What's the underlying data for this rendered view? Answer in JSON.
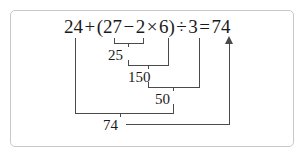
{
  "figure": {
    "line_color": "#4a4a4a",
    "frame_color": "#c9c9c9",
    "text_color": "#1a1a1a"
  },
  "equation": {
    "full_text": "24+(27-2×6)÷3=74",
    "tokens": [
      {
        "text": "24",
        "kind": "number"
      },
      {
        "text": "+",
        "kind": "operator"
      },
      {
        "text": "(",
        "kind": "paren"
      },
      {
        "text": "27",
        "kind": "number"
      },
      {
        "text": "−",
        "kind": "operator"
      },
      {
        "text": "2",
        "kind": "number"
      },
      {
        "text": "×",
        "kind": "operator"
      },
      {
        "text": "6",
        "kind": "number"
      },
      {
        "text": ")",
        "kind": "paren"
      },
      {
        "text": "÷",
        "kind": "operator"
      },
      {
        "text": "3",
        "kind": "number"
      },
      {
        "text": "=",
        "kind": "operator"
      },
      {
        "text": "74",
        "kind": "number"
      }
    ]
  },
  "steps": [
    {
      "order": 1,
      "operation": "27 − 2",
      "result": "25"
    },
    {
      "order": 2,
      "operation": "25 × 6",
      "result": "150"
    },
    {
      "order": 3,
      "operation": "150 ÷ 3",
      "result": "50"
    },
    {
      "order": 4,
      "operation": "24 + 50",
      "result": "74"
    }
  ],
  "final_answer": "74"
}
